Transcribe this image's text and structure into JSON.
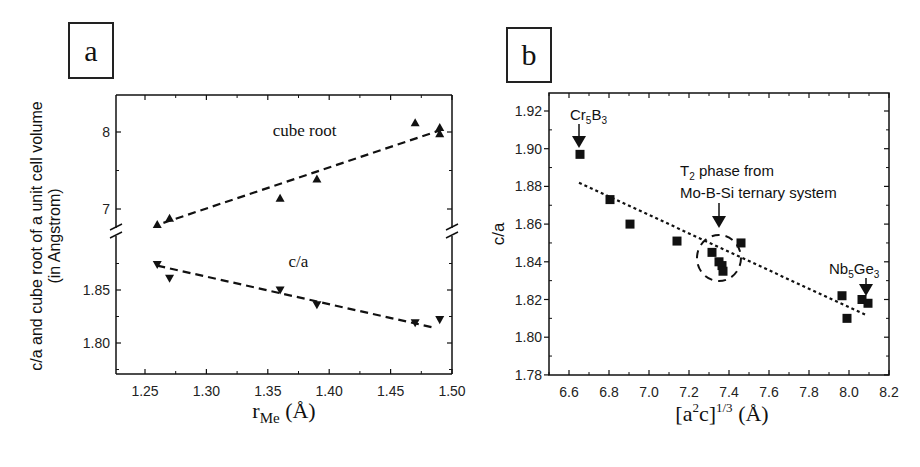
{
  "panels": {
    "a": {
      "label": "a"
    },
    "b": {
      "label": "b"
    }
  },
  "chart_data": [
    {
      "id": "a",
      "type": "scatter",
      "title": "",
      "xlabel": "r_Me (Å)",
      "xlabel_main": "r",
      "xlabel_sub": "Me",
      "xlabel_unit": "(Å)",
      "ylabel": "c/a and cube root of a unit cell volume",
      "ylabel_line2": "(in Angstrom)",
      "xlim": [
        1.226,
        1.5
      ],
      "x_ticks": [
        1.25,
        1.3,
        1.35,
        1.4,
        1.45,
        1.5
      ],
      "x_tick_labels": [
        "1.25",
        "1.30",
        "1.35",
        "1.40",
        "1.45",
        "1.50"
      ],
      "broken_y_axis": true,
      "upper_ylim": [
        6.72,
        8.5
      ],
      "upper_y_ticks": [
        7,
        8
      ],
      "upper_y_tick_labels": [
        "7",
        "8"
      ],
      "lower_ylim": [
        1.77,
        1.895
      ],
      "lower_y_ticks": [
        1.8,
        1.85
      ],
      "lower_y_tick_labels": [
        "1.80",
        "1.85"
      ],
      "grid": false,
      "series": [
        {
          "name": "cube root",
          "marker": "triangle-up",
          "x": [
            1.26,
            1.27,
            1.36,
            1.39,
            1.47,
            1.49,
            1.49
          ],
          "y": [
            6.8,
            6.88,
            7.14,
            7.39,
            8.12,
            8.06,
            7.98
          ],
          "fit_line": {
            "x": [
              1.265,
              1.49
            ],
            "y": [
              6.82,
              8.02
            ],
            "style": "dashed"
          }
        },
        {
          "name": "c/a",
          "marker": "triangle-down",
          "x": [
            1.26,
            1.27,
            1.36,
            1.39,
            1.47,
            1.49
          ],
          "y": [
            1.874,
            1.861,
            1.85,
            1.836,
            1.819,
            1.822
          ],
          "fit_line": {
            "x": [
              1.26,
              1.487
            ],
            "y": [
              1.873,
              1.814
            ],
            "style": "dashed"
          }
        }
      ],
      "annotations": [
        {
          "text": "cube root",
          "x": 1.38,
          "y": 7.95
        },
        {
          "text": "c/a",
          "x": 1.375,
          "y": 1.872
        }
      ]
    },
    {
      "id": "b",
      "type": "scatter",
      "title": "",
      "xlabel": "[a²c]^(1/3) (Å)",
      "xlabel_main": "[a",
      "xlabel_sup1": "2",
      "xlabel_mid": "c]",
      "xlabel_sup2": "1/3",
      "xlabel_unit": "(Å)",
      "ylabel": "c/a",
      "xlim": [
        6.5,
        8.2
      ],
      "ylim": [
        1.78,
        1.925
      ],
      "x_ticks": [
        6.6,
        6.8,
        7.0,
        7.2,
        7.4,
        7.6,
        7.8,
        8.0,
        8.2
      ],
      "x_tick_labels": [
        "6.6",
        "6.8",
        "7.0",
        "7.2",
        "7.4",
        "7.6",
        "7.8",
        "8.0",
        "8.2"
      ],
      "y_ticks": [
        1.78,
        1.8,
        1.82,
        1.84,
        1.86,
        1.88,
        1.9,
        1.92
      ],
      "y_tick_labels": [
        "1.78",
        "1.80",
        "1.82",
        "1.84",
        "1.86",
        "1.88",
        "1.90",
        "1.92"
      ],
      "grid": false,
      "series": [
        {
          "name": "compounds",
          "marker": "square",
          "x": [
            6.655,
            6.805,
            6.905,
            7.14,
            7.315,
            7.35,
            7.365,
            7.37,
            7.46,
            7.965,
            7.99,
            8.065,
            8.095
          ],
          "y": [
            1.897,
            1.873,
            1.86,
            1.851,
            1.845,
            1.84,
            1.838,
            1.835,
            1.85,
            1.822,
            1.81,
            1.82,
            1.818
          ],
          "fit_line": {
            "x": [
              6.65,
              8.08
            ],
            "y": [
              1.882,
              1.812
            ],
            "style": "dotted"
          }
        }
      ],
      "annotations": [
        {
          "text": "Cr5B3",
          "main1": "Cr",
          "sub1": "5",
          "main2": "B",
          "sub2": "3",
          "arrow_to": [
            6.655,
            1.897
          ]
        },
        {
          "text": "T2 phase from",
          "main": "T",
          "sub": "2",
          "rest": " phase from"
        },
        {
          "text": "Mo-B-Si ternary system",
          "arrow_to": [
            7.35,
            1.845
          ],
          "circle_center": [
            7.35,
            1.842
          ]
        },
        {
          "text": "Nb5Ge3",
          "main1": "Nb",
          "sub1": "5",
          "main2": "Ge",
          "sub2": "3",
          "arrow_to": [
            8.085,
            1.822
          ]
        }
      ]
    }
  ]
}
